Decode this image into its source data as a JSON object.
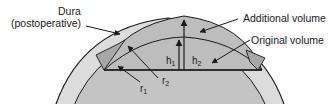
{
  "labels": {
    "dura_line1": "Dura",
    "dura_line2": "(postoperative)",
    "additional_volume": "Additional volume",
    "original_volume": "Original volume"
  },
  "symbols": {
    "h1": {
      "base": "h",
      "sub": "1"
    },
    "h2": {
      "base": "h",
      "sub": "2"
    },
    "r1": {
      "base": "r",
      "sub": "1"
    },
    "r2": {
      "base": "r",
      "sub": "2"
    }
  },
  "colors": {
    "skull_band": "#dcdcdc",
    "brain": "#c4c4c4",
    "additional_volume": "#bdbdbd",
    "bone_flap": "#a8a8a8",
    "stroke": "#1a1a1a",
    "background": "#ffffff"
  }
}
